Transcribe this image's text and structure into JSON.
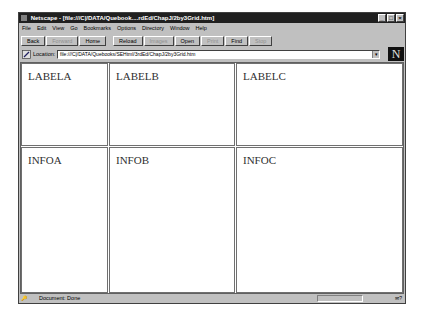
{
  "window": {
    "title": "Netscape - [file:///C|/DATA/Quebook....rdEd/ChapJ/2by3Grid.htm]",
    "controls": [
      "minimize",
      "maximize",
      "close"
    ]
  },
  "menubar": {
    "items": [
      "File",
      "Edit",
      "View",
      "Go",
      "Bookmarks",
      "Options",
      "Directory",
      "Window",
      "Help"
    ]
  },
  "toolbar": {
    "buttons": [
      {
        "label": "Back",
        "enabled": true
      },
      {
        "label": "Forward",
        "enabled": false
      },
      {
        "label": "Home",
        "enabled": true
      },
      {
        "label": "Reload",
        "enabled": true
      },
      {
        "label": "Images",
        "enabled": false
      },
      {
        "label": "Open",
        "enabled": true
      },
      {
        "label": "Print",
        "enabled": false
      },
      {
        "label": "Find",
        "enabled": true
      },
      {
        "label": "Stop",
        "enabled": false
      }
    ]
  },
  "location": {
    "label": "Location:",
    "value": "file:///C|/DATA/Quebooks/SEHtml/3rdEd/ChapJ/2by3Grid.htm",
    "logo": "N"
  },
  "frames": {
    "row1": [
      "LABELA",
      "LABELB",
      "LABELC"
    ],
    "row2": [
      "INFOA",
      "INFOB",
      "INFOC"
    ]
  },
  "status": {
    "text": "Document: Done",
    "security_icon": "key-icon",
    "mail_icon": "mail-icon"
  }
}
